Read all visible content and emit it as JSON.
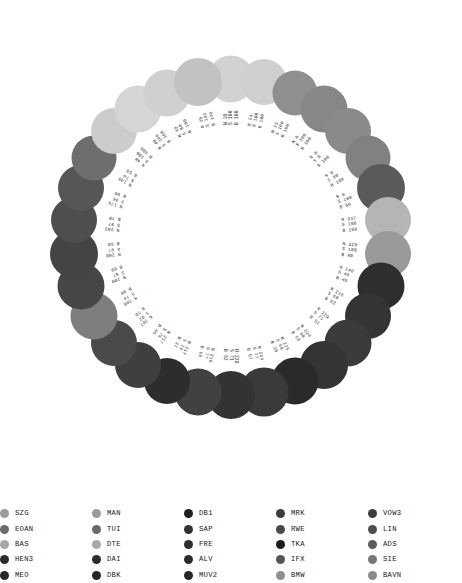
{
  "chart_data": {
    "type": "scatter",
    "title": "",
    "subtitle": "",
    "layout": {
      "arrangement": "circular-ring",
      "center_x": 231,
      "center_y": 237,
      "node_radius": 158,
      "label_radius": 112,
      "grid": false,
      "legend_position": "bottom"
    },
    "value_keys": [
      "N",
      "S",
      "B"
    ],
    "nodes": [
      {
        "index": 0,
        "angle": -90,
        "label_n": "N 35",
        "label_s": "S 100",
        "label_b": "B 100",
        "color": "#d2d2d2",
        "r": 23.5
      },
      {
        "index": 1,
        "angle": -78,
        "label_n": "N 24",
        "label_s": "S 100",
        "label_b": "B 100",
        "color": "#cfcfcf",
        "r": 23.0
      },
      {
        "index": 2,
        "angle": -66,
        "label_n": "N 11",
        "label_s": "S 100",
        "label_b": "B 100",
        "color": "#8f8f8f",
        "r": 22.5
      },
      {
        "index": 3,
        "angle": -54,
        "label_n": "N 0",
        "label_s": "S 100",
        "label_b": "B 100",
        "color": "#878787",
        "r": 23.5
      },
      {
        "index": 4,
        "angle": -42,
        "label_n": "N 0",
        "label_s": "S 0",
        "label_b": "B 100",
        "color": "#8a8a8a",
        "r": 23.0
      },
      {
        "index": 5,
        "angle": -30,
        "label_n": "N 0",
        "label_s": "S 80",
        "label_b": "B 100",
        "color": "#818181",
        "r": 22.5
      },
      {
        "index": 6,
        "angle": -18,
        "label_n": "N 0",
        "label_s": "S 100",
        "label_b": "B 80",
        "color": "#5a5a5a",
        "r": 24.0
      },
      {
        "index": 7,
        "angle": -6,
        "label_n": "N 347",
        "label_s": "S 100",
        "label_b": "B 100",
        "color": "#b5b5b5",
        "r": 23.0
      },
      {
        "index": 8,
        "angle": 6,
        "label_n": "N 328",
        "label_s": "S 100",
        "label_b": "B 80",
        "color": "#9a9a9a",
        "r": 23.0
      },
      {
        "index": 9,
        "angle": 18,
        "label_n": "N 240",
        "label_s": "S 49",
        "label_b": "B 40",
        "color": "#2e2e2e",
        "r": 23.5
      },
      {
        "index": 10,
        "angle": 30,
        "label_n": "N 216",
        "label_s": "S 68",
        "label_b": "B 53",
        "color": "#343434",
        "r": 23.0
      },
      {
        "index": 11,
        "angle": 42,
        "label_n": "N 229",
        "label_s": "S 71",
        "label_b": "B 57",
        "color": "#3b3b3b",
        "r": 23.5
      },
      {
        "index": 12,
        "angle": 54,
        "label_n": "N 224",
        "label_s": "S 68",
        "label_b": "B 53",
        "color": "#343434",
        "r": 24.0
      },
      {
        "index": 13,
        "angle": 66,
        "label_n": "N 225",
        "label_s": "S 68",
        "label_b": "B 38",
        "color": "#2a2a2a",
        "r": 23.5
      },
      {
        "index": 14,
        "angle": 78,
        "label_n": "N 224",
        "label_s": "S 77",
        "label_b": "B 57",
        "color": "#3a3a3a",
        "r": 24.5
      },
      {
        "index": 15,
        "angle": 90,
        "label_n": "N 228",
        "label_s": "S 71",
        "label_b": "B 52",
        "color": "#333333",
        "r": 24.0
      },
      {
        "index": 16,
        "angle": 102,
        "label_n": "N 219",
        "label_s": "S 77",
        "label_b": "B 66",
        "color": "#414141",
        "r": 23.5
      },
      {
        "index": 17,
        "angle": 114,
        "label_n": "N 217",
        "label_s": "S 74",
        "label_b": "B 37",
        "color": "#2d2d2d",
        "r": 23.0
      },
      {
        "index": 18,
        "angle": 126,
        "label_n": "N 217",
        "label_s": "S 76",
        "label_b": "B 66",
        "color": "#3f3f3f",
        "r": 23.0
      },
      {
        "index": 19,
        "angle": 138,
        "label_n": "N 207",
        "label_s": "S 92",
        "label_b": "B 70",
        "color": "#4a4a4a",
        "r": 23.0
      },
      {
        "index": 20,
        "angle": 150,
        "label_n": "N 200",
        "label_s": "S 74",
        "label_b": "B 80",
        "color": "#7e7e7e",
        "r": 23.5
      },
      {
        "index": 21,
        "angle": 162,
        "label_n": "N 200",
        "label_s": "S 97",
        "label_b": "B 60",
        "color": "#464646",
        "r": 23.5
      },
      {
        "index": 22,
        "angle": 174,
        "label_n": "N 200",
        "label_s": "S 97",
        "label_b": "B 60",
        "color": "#444444",
        "r": 24.0
      },
      {
        "index": 23,
        "angle": 186,
        "label_n": "N 203",
        "label_s": "S 97",
        "label_b": "B 70",
        "color": "#4e4e4e",
        "r": 23.0
      },
      {
        "index": 24,
        "angle": 198,
        "label_n": "N 179",
        "label_s": "S 96",
        "label_b": "B 60",
        "color": "#565656",
        "r": 23.0
      },
      {
        "index": 25,
        "angle": 210,
        "label_n": "N 140",
        "label_s": "S 74",
        "label_b": "B 58",
        "color": "#6e6e6e",
        "r": 22.5
      },
      {
        "index": 26,
        "angle": 222,
        "label_n": "N 48",
        "label_s": "S 100",
        "label_b": "B 100",
        "color": "#cccccc",
        "r": 23.0
      },
      {
        "index": 27,
        "angle": 234,
        "label_n": "N 48",
        "label_s": "S 100",
        "label_b": "B 100",
        "color": "#d5d5d5",
        "r": 23.5
      },
      {
        "index": 28,
        "angle": 246,
        "label_n": "N 49",
        "label_s": "S 80",
        "label_b": "B 100",
        "color": "#d0d0d0",
        "r": 23.5
      },
      {
        "index": 29,
        "angle": 258,
        "label_n": "N 35",
        "label_s": "S 100",
        "label_b": "B 100",
        "color": "#c2c2c2",
        "r": 24.0
      }
    ]
  },
  "legend": {
    "columns": [
      {
        "left": 0,
        "items": [
          {
            "label": "SZG",
            "color": "#9b9b9b"
          },
          {
            "label": "EOAN",
            "color": "#6a6a6a"
          },
          {
            "label": "BAS",
            "color": "#a8a8a8"
          },
          {
            "label": "HEN3",
            "color": "#2b2b2b"
          },
          {
            "label": "MEO",
            "color": "#262626"
          }
        ]
      },
      {
        "left": 92,
        "items": [
          {
            "label": "MAN",
            "color": "#9b9b9b"
          },
          {
            "label": "TUI",
            "color": "#6a6a6a"
          },
          {
            "label": "DTE",
            "color": "#a8a8a8"
          },
          {
            "label": "DAI",
            "color": "#2b2b2b"
          },
          {
            "label": "DBK",
            "color": "#262626"
          }
        ]
      },
      {
        "left": 184,
        "items": [
          {
            "label": "DB1",
            "color": "#1e1e1e"
          },
          {
            "label": "SAP",
            "color": "#333333"
          },
          {
            "label": "FRE",
            "color": "#2e2e2e"
          },
          {
            "label": "ALV",
            "color": "#2b2b2b"
          },
          {
            "label": "MUV2",
            "color": "#272727"
          }
        ]
      },
      {
        "left": 276,
        "items": [
          {
            "label": "MRK",
            "color": "#3c3c3c"
          },
          {
            "label": "RWE",
            "color": "#4a4a4a"
          },
          {
            "label": "TKA",
            "color": "#1d1d1d"
          },
          {
            "label": "IFX",
            "color": "#555555"
          },
          {
            "label": "BMW",
            "color": "#8f8f8f"
          }
        ]
      },
      {
        "left": 368,
        "items": [
          {
            "label": "VOW3",
            "color": "#3e3e3e"
          },
          {
            "label": "LIN",
            "color": "#4e4e4e"
          },
          {
            "label": "ADS",
            "color": "#5c5c5c"
          },
          {
            "label": "SIE",
            "color": "#777777"
          },
          {
            "label": "BAVN",
            "color": "#8a8a8a"
          }
        ]
      }
    ]
  }
}
